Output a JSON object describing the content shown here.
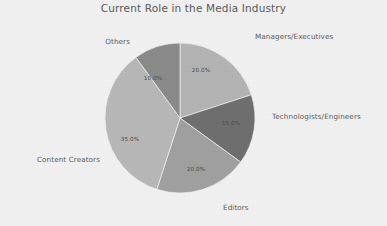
{
  "chart_data": {
    "type": "pie",
    "title": "Current Role in the Media Industry",
    "xlabel": "",
    "ylabel": "",
    "legend": "none",
    "grid": false,
    "autopct_format": "%.1f%%",
    "start_angle_deg": 90,
    "direction": "clockwise",
    "categories": [
      "Managers/Executives",
      "Technologists/Engineers",
      "Editors",
      "Content Creators",
      "Others"
    ],
    "values": [
      20.0,
      15.0,
      20.0,
      35.0,
      10.0
    ],
    "value_labels": [
      "20.0%",
      "15.0%",
      "20.0%",
      "35.0%",
      "10.0%"
    ],
    "colors": [
      "#b4b4b4",
      "#6e6e6e",
      "#a0a0a0",
      "#b8b8b8",
      "#8a8a8a"
    ],
    "slices": [
      {
        "label": "Managers/Executives",
        "value": 20.0,
        "value_label": "20.0%",
        "color": "#b4b4b4",
        "start_deg": 90,
        "end_deg": 18,
        "label_x": 255,
        "label_y": 36,
        "label_anchor": "start",
        "pct_x": 201,
        "pct_y": 70
      },
      {
        "label": "Technologists/Engineers",
        "value": 15.0,
        "value_label": "15.0%",
        "color": "#6e6e6e",
        "start_deg": 18,
        "end_deg": -36,
        "label_x": 272,
        "label_y": 116,
        "label_anchor": "start",
        "pct_x": 231,
        "pct_y": 123
      },
      {
        "label": "Editors",
        "value": 20.0,
        "value_label": "20.0%",
        "color": "#a0a0a0",
        "start_deg": -36,
        "end_deg": -108,
        "label_x": 223,
        "label_y": 207,
        "label_anchor": "start",
        "pct_x": 196,
        "pct_y": 169
      },
      {
        "label": "Content Creators",
        "value": 35.0,
        "value_label": "35.0%",
        "color": "#b8b8b8",
        "start_deg": -108,
        "end_deg": -234,
        "label_x": 100,
        "label_y": 159,
        "label_anchor": "end",
        "pct_x": 130,
        "pct_y": 139
      },
      {
        "label": "Others",
        "value": 10.0,
        "value_label": "10.0%",
        "color": "#8a8a8a",
        "start_deg": -234,
        "end_deg": -270,
        "label_x": 130,
        "label_y": 41,
        "label_anchor": "end",
        "pct_x": 153,
        "pct_y": 78
      }
    ],
    "geometry": {
      "center_x": 180,
      "center_y": 118,
      "radius": 75
    },
    "style": {
      "background": "#f2f2f2",
      "title_color": "#595959",
      "label_color": "#5a5a5a",
      "pct_color": "#4a4a4a",
      "wedge_edge_color": "#f2f2f2"
    }
  }
}
